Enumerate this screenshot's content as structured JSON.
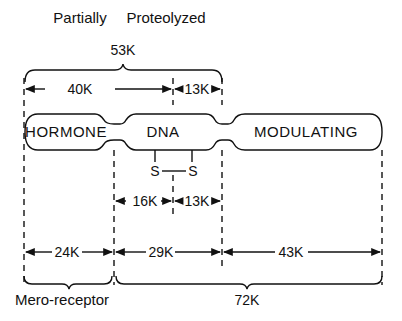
{
  "title": {
    "left": "Partially",
    "right": "Proteolyzed"
  },
  "top_brace_label": "53K",
  "top_segments": [
    {
      "label": "40K"
    },
    {
      "label": "13K"
    }
  ],
  "domains": [
    {
      "label": "HORMONE"
    },
    {
      "label": "DNA"
    },
    {
      "label": "MODULATING"
    }
  ],
  "disulfide": {
    "left": "S",
    "right": "S"
  },
  "mid_segments": [
    {
      "label": "16K"
    },
    {
      "label": "13K"
    }
  ],
  "bottom_segments": [
    {
      "label": "24K"
    },
    {
      "label": "29K"
    },
    {
      "label": "43K"
    }
  ],
  "bottom_braces": [
    {
      "label": "Mero-receptor"
    },
    {
      "label": "72K"
    }
  ]
}
